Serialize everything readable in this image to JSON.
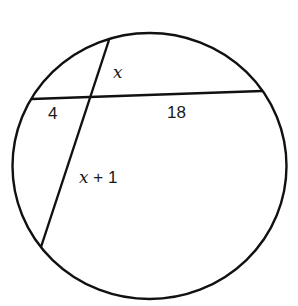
{
  "diagram": {
    "type": "intersecting-chords-in-circle",
    "circle": {
      "cx": 149.5,
      "cy": 166,
      "rx": 137,
      "ry": 133
    },
    "chords": [
      {
        "name": "horizontal-chord",
        "x1": 32,
        "y1": 99,
        "x2": 262,
        "y2": 91
      },
      {
        "name": "slanted-chord",
        "x1": 109,
        "y1": 40,
        "x2": 41,
        "y2": 247
      }
    ],
    "labels": {
      "upper_segment": "x",
      "left_segment": "4",
      "right_segment": "18",
      "lower_segment_var": "x",
      "lower_segment_rest": " + 1"
    },
    "stroke_color": "#111111"
  }
}
